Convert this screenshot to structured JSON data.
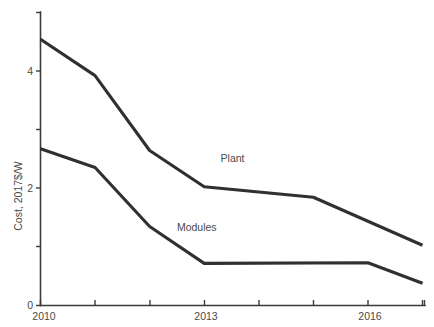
{
  "chart_data": {
    "type": "line",
    "title": "",
    "subtitle": "",
    "xlabel": "",
    "ylabel": "Cost, 2017$/W",
    "xlim": [
      2010,
      2017
    ],
    "ylim": [
      0,
      5
    ],
    "grid": false,
    "legend_position": "inline-annotation",
    "x": [
      2010,
      2011,
      2012,
      2013,
      2014,
      2015,
      2016,
      2017
    ],
    "x_tick_values": [
      2010,
      2011,
      2012,
      2013,
      2014,
      2015,
      2016,
      2017
    ],
    "x_tick_labels": [
      "2010",
      "",
      "",
      "2013",
      "",
      "",
      "2016",
      ""
    ],
    "y_tick_values": [
      0,
      1,
      2,
      3,
      4,
      5
    ],
    "y_tick_labels": [
      "0",
      "",
      "2",
      "",
      "4",
      ""
    ],
    "series": [
      {
        "name": "Plant",
        "label": "Plant",
        "color": "#332f2f",
        "x": [
          2010,
          2011,
          2012,
          2013,
          2015,
          2017
        ],
        "values": [
          4.55,
          3.93,
          2.65,
          2.03,
          1.85,
          1.03
        ],
        "annotation": {
          "text": "Plant",
          "x": 2013.3,
          "y": 2.45
        }
      },
      {
        "name": "Modules",
        "label": "Modules",
        "color": "#332f2f",
        "x": [
          2010,
          2011,
          2012,
          2013,
          2016,
          2017
        ],
        "values": [
          2.68,
          2.36,
          1.35,
          0.72,
          0.73,
          0.38
        ],
        "annotation": {
          "text": "Modules",
          "x": 2012.5,
          "y": 1.28
        }
      }
    ]
  },
  "axis": {
    "y_title": "Cost, 2017$/W",
    "y_labels": [
      {
        "text": "0",
        "value": 0
      },
      {
        "text": "2",
        "value": 2
      },
      {
        "text": "4",
        "value": 4
      }
    ],
    "x_labels": [
      {
        "text": "2010",
        "value": 2010
      },
      {
        "text": "2013",
        "value": 2013
      },
      {
        "text": "2016",
        "value": 2016
      }
    ]
  },
  "annotations": {
    "plant": "Plant",
    "modules": "Modules"
  },
  "colors": {
    "line": "#332f2f",
    "axis": "#3b3b3b",
    "text": "#4a4a4a",
    "background": "#ffffff"
  }
}
